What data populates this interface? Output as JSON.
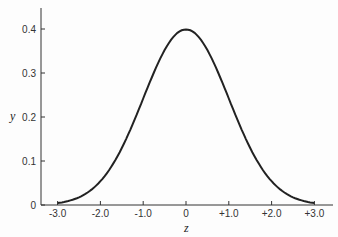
{
  "chart_data": {
    "type": "line",
    "title": "",
    "xlabel": "z",
    "ylabel": "y",
    "xlim": [
      -3.0,
      3.0
    ],
    "ylim": [
      0,
      0.45
    ],
    "grid": false,
    "legend": null,
    "x_ticks": [
      "-3.0",
      "-2.0",
      "-1.0",
      "0",
      "+1.0",
      "+2.0",
      "+3.0"
    ],
    "y_ticks": [
      "0",
      "0.1",
      "0.2",
      "0.3",
      "0.4"
    ],
    "series": [
      {
        "name": "standard normal density",
        "x": [
          -3.0,
          -2.5,
          -2.0,
          -1.5,
          -1.0,
          -0.5,
          0,
          0.5,
          1.0,
          1.5,
          2.0,
          2.5,
          3.0
        ],
        "y": [
          0.004,
          0.018,
          0.054,
          0.13,
          0.242,
          0.352,
          0.399,
          0.352,
          0.242,
          0.13,
          0.054,
          0.018,
          0.004
        ]
      }
    ]
  }
}
